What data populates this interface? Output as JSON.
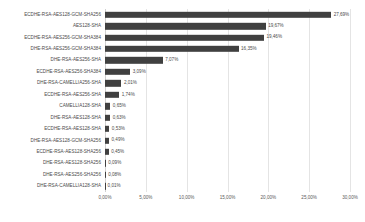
{
  "chart_data": {
    "type": "bar",
    "orientation": "horizontal",
    "title": "",
    "subtitle": "",
    "xlabel": "",
    "ylabel": "",
    "xlim": [
      0,
      30
    ],
    "grid": true,
    "legend": false,
    "value_suffix": "%",
    "xticks": [
      "0,00%",
      "5,00%",
      "10,00%",
      "15,00%",
      "20,00%",
      "25,00%",
      "30,00%"
    ],
    "xtick_values": [
      0,
      5,
      10,
      15,
      20,
      25,
      30
    ],
    "bar_color": "#404040",
    "gridline_color": "#e4e4e4",
    "background_color": "#ffffff",
    "categories": [
      "ECDHE-RSA-AES128-GCM-SHA256",
      "AES128-SHA",
      "ECDHE-RSA-AES256-GCM-SHA384",
      "DHE-RSA-AES256-GCM-SHA384",
      "DHE-RSA-AES256-SHA",
      "ECDHE-RSA-AES256-SHA384",
      "DHE-RSA-CAMELLIA256-SHA",
      "ECDHE-RSA-AES256-SHA",
      "CAMELLIA128-SHA",
      "DHE-RSA-AES128-SHA",
      "ECDHE-RSA-AES128-SHA",
      "DHE-RSA-AES128-GCM-SHA256",
      "ECDHE-RSA-AES128-SHA256",
      "DHE-RSA-AES128-SHA256",
      "DHE-RSA-AES256-SHA256",
      "DHE-RSA-CAMELLIA128-SHA"
    ],
    "values": [
      27.69,
      19.67,
      19.46,
      16.35,
      7.07,
      3.09,
      2.01,
      1.74,
      0.65,
      0.63,
      0.53,
      0.49,
      0.45,
      0.09,
      0.08,
      0.01
    ],
    "value_labels": [
      "27,69%",
      "19,67%",
      "19,46%",
      "16,35%",
      "7,07%",
      "3,09%",
      "2,01%",
      "1,74%",
      "0,65%",
      "0,63%",
      "0,53%",
      "0,49%",
      "0,45%",
      "0,09%",
      "0,08%",
      "0,01%"
    ]
  }
}
